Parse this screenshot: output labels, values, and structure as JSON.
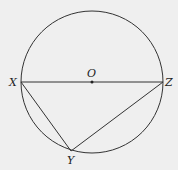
{
  "diagram": {
    "type": "circle-inscribed-triangle",
    "background": "#efefef",
    "stroke_color": "#333333",
    "circle": {
      "cx": 92,
      "cy": 82,
      "r": 71
    },
    "points": {
      "O": {
        "label": "O",
        "x": 92,
        "y": 82
      },
      "X": {
        "label": "X",
        "x": 21,
        "y": 82
      },
      "Z": {
        "label": "Z",
        "x": 163,
        "y": 82
      },
      "Y": {
        "label": "Y",
        "x": 71,
        "y": 151
      }
    },
    "segments": [
      [
        "X",
        "Z"
      ],
      [
        "X",
        "Y"
      ],
      [
        "Y",
        "Z"
      ]
    ]
  }
}
